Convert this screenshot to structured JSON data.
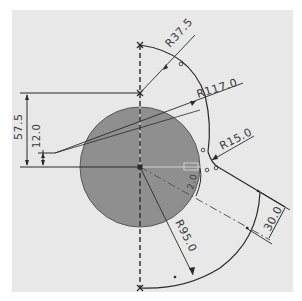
{
  "drawing": {
    "background": "#ffffff",
    "sheet_color": "#e8e8e8",
    "circle_fill": "#8f8f8f",
    "line_color": "#2a2a2a",
    "dimensions": {
      "r37_5": "R37.5",
      "r117_0": "R117.0",
      "r15_0": "R15.0",
      "r95_0": "R95.0",
      "d57_5": "57.5",
      "d12_0": "12.0",
      "d30_0": "30.0",
      "small_angle_label": "2.0"
    }
  }
}
